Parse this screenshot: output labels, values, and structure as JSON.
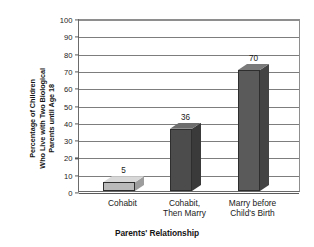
{
  "chart_data": {
    "type": "bar",
    "title": "",
    "subtitle": "",
    "xlabel": "Parents' Relationship",
    "ylabel": "Percentage of Children Who Live with Two Biological Parents until Age 18",
    "ylabel_lines": [
      "Percentage of Children",
      "Who Live with Two Biological",
      "Parents until Age 18"
    ],
    "categories": [
      "Cohabit",
      "Cohabit, Then Marry",
      "Marry before Child's Birth"
    ],
    "category_lines": [
      [
        "Cohabit"
      ],
      [
        "Cohabit,",
        "Then Marry"
      ],
      [
        "Marry before",
        "Child's Birth"
      ]
    ],
    "values": [
      5,
      36,
      70
    ],
    "data_labels": [
      "5",
      "36",
      "70"
    ],
    "ylim": [
      0,
      100
    ],
    "ytick_step": 10,
    "yticks": [
      0,
      10,
      20,
      30,
      40,
      50,
      60,
      70,
      80,
      90,
      100
    ],
    "ytick_labels": [
      "0",
      "10",
      "20",
      "30",
      "40",
      "50",
      "60",
      "70",
      "80",
      "90",
      "100"
    ],
    "grid": true,
    "legend": false,
    "legend_position": "none",
    "three_d": true,
    "bar_colors": [
      "#b9b9b9",
      "#4c4c4c",
      "#5a5a5a"
    ],
    "bar_top_colors": [
      "#d8d8d8",
      "#6d6d6d",
      "#7a7a7a"
    ],
    "bar_side_colors": [
      "#9d9d9d",
      "#3a3a3a",
      "#444444"
    ],
    "gridline_color": "#7d7d7d",
    "axis_color": "#5a5a5a",
    "background_color": "#ffffff",
    "text_color": "#1a1a1a"
  }
}
